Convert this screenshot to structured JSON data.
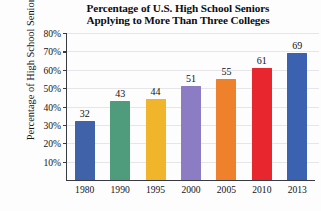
{
  "chart_data": {
    "type": "bar",
    "title": "Percentage of U.S. High School Seniors Applying to More Than Three Colleges",
    "title_lines": [
      "Percentage of U.S. High School Seniors",
      "Applying to More Than Three Colleges"
    ],
    "xlabel": "",
    "ylabel": "Percentage of High School Seniors",
    "categories": [
      "1980",
      "1990",
      "1995",
      "2000",
      "2005",
      "2010",
      "2013"
    ],
    "values": [
      32,
      43,
      44,
      51,
      55,
      61,
      69
    ],
    "value_labels": [
      "32",
      "43",
      "44",
      "51",
      "55",
      "61",
      "69"
    ],
    "ylim": [
      0,
      80
    ],
    "ytick_values": [
      10,
      20,
      30,
      40,
      50,
      60,
      70,
      80
    ],
    "ytick_labels": [
      "10%",
      "20%",
      "30%",
      "40%",
      "50%",
      "60%",
      "70%",
      "80%"
    ],
    "grid": true,
    "legend": "none",
    "bar_colors": [
      "#3f62a8",
      "#4e9c7c",
      "#f0b52a",
      "#8b7cc4",
      "#f0812c",
      "#e8262e",
      "#3a62b0"
    ]
  }
}
